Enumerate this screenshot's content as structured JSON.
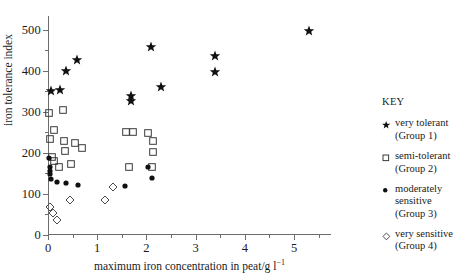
{
  "chart_data": {
    "type": "scatter",
    "title": "",
    "xlabel": "maximum iron concentration in peat/g l⁻¹",
    "ylabel": "iron tolerance index",
    "xlim": [
      0,
      5.75
    ],
    "ylim": [
      0,
      534
    ],
    "xticks": [
      0,
      1,
      2,
      3,
      4,
      5
    ],
    "xtick_labels": [
      "0",
      "1",
      "2",
      "3",
      "4",
      "5"
    ],
    "xticks_minor": [
      0.5,
      1.5,
      2.5,
      3.5,
      4.5,
      5.5
    ],
    "yticks": [
      0,
      100,
      200,
      300,
      400,
      500
    ],
    "ytick_labels": [
      "0",
      "100",
      "200",
      "300",
      "400",
      "500"
    ],
    "yticks_minor": [
      50,
      150,
      250,
      350,
      450
    ],
    "grid": false,
    "legend_position": "right",
    "series": [
      {
        "name": "very tolerant",
        "group": "Group 1",
        "marker": "star-filled",
        "color": "#101010",
        "points": [
          [
            0.06,
            351
          ],
          [
            0.24,
            354
          ],
          [
            0.37,
            400
          ],
          [
            0.59,
            427
          ],
          [
            1.69,
            339
          ],
          [
            1.69,
            327
          ],
          [
            2.1,
            459
          ],
          [
            2.29,
            361
          ],
          [
            3.39,
            437
          ],
          [
            3.39,
            398
          ],
          [
            5.31,
            498
          ]
        ]
      },
      {
        "name": "semi-tolerant",
        "group": "Group 2",
        "marker": "square-open",
        "color": "#3a3a3a",
        "points": [
          [
            0.02,
            298
          ],
          [
            0.04,
            234
          ],
          [
            0.08,
            191
          ],
          [
            0.12,
            255
          ],
          [
            0.12,
            180
          ],
          [
            0.22,
            166
          ],
          [
            0.31,
            305
          ],
          [
            0.33,
            230
          ],
          [
            0.35,
            205
          ],
          [
            0.47,
            174
          ],
          [
            0.55,
            224
          ],
          [
            0.69,
            213
          ],
          [
            1.59,
            252
          ],
          [
            1.73,
            250
          ],
          [
            1.65,
            166
          ],
          [
            2.04,
            248
          ],
          [
            2.14,
            230
          ],
          [
            2.14,
            203
          ],
          [
            2.12,
            166
          ]
        ]
      },
      {
        "name": "moderately sensitive",
        "group": "Group 3",
        "marker": "circle-filled",
        "color": "#101010",
        "points": [
          [
            0.02,
            188
          ],
          [
            0.04,
            166
          ],
          [
            0.04,
            156
          ],
          [
            0.04,
            148
          ],
          [
            0.06,
            136
          ],
          [
            0.18,
            129
          ],
          [
            0.37,
            126
          ],
          [
            0.61,
            122
          ],
          [
            1.57,
            120
          ],
          [
            2.04,
            166
          ],
          [
            2.12,
            139
          ]
        ]
      },
      {
        "name": "very sensitive",
        "group": "Group 4",
        "marker": "diamond-open",
        "color": "#4a4a4a",
        "points": [
          [
            0.04,
            68
          ],
          [
            0.1,
            54
          ],
          [
            0.18,
            37
          ],
          [
            0.45,
            85
          ],
          [
            1.16,
            85
          ],
          [
            1.33,
            117
          ]
        ]
      }
    ]
  },
  "legend": {
    "title": "KEY",
    "entries": [
      {
        "marker": "star-filled",
        "label": "very tolerant\n(Group 1)"
      },
      {
        "marker": "square-open",
        "label": "semi-tolerant\n(Group 2)"
      },
      {
        "marker": "circle-filled",
        "label": "moderately\nsensitive\n(Group 3)"
      },
      {
        "marker": "diamond-open",
        "label": "very sensitive\n(Group 4)"
      }
    ]
  }
}
